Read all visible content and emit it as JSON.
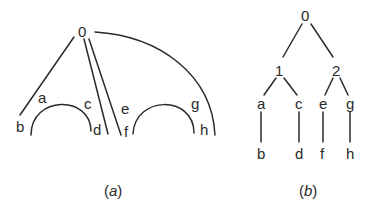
{
  "figure_a": {
    "caption_open": "(",
    "caption_letter": "a",
    "caption_close": ")",
    "nodes": {
      "root": "0",
      "a": "a",
      "b": "b",
      "c": "c",
      "d": "d",
      "e": "e",
      "f": "f",
      "g": "g",
      "h": "h"
    }
  },
  "figure_b": {
    "caption_open": "(",
    "caption_letter": "b",
    "caption_close": ")",
    "nodes": {
      "root": "0",
      "n1": "1",
      "n2": "2",
      "a": "a",
      "c": "c",
      "e": "e",
      "g": "g",
      "b": "b",
      "d": "d",
      "f": "f",
      "h": "h"
    }
  }
}
